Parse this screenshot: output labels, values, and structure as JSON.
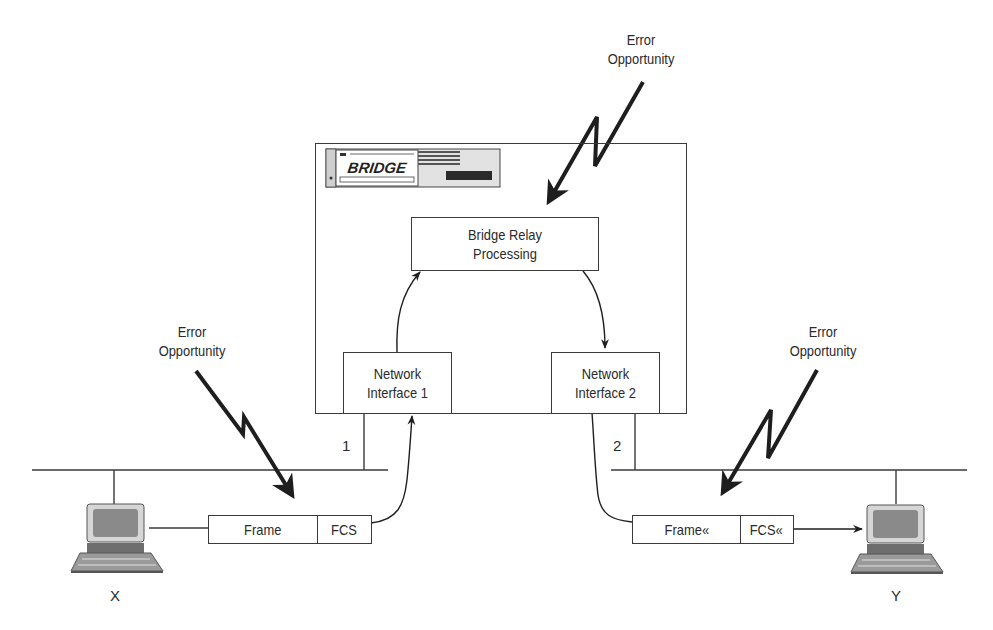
{
  "diagram": {
    "type": "network-bridge-error-opportunities",
    "bridge": {
      "device_label": "BRIDGE",
      "relay": {
        "line1": "Bridge Relay",
        "line2": "Processing"
      },
      "interfaces": [
        {
          "line1": "Network",
          "line2": "Interface 1",
          "port": "1"
        },
        {
          "line1": "Network",
          "line2": "Interface 2",
          "port": "2"
        }
      ]
    },
    "error_labels": [
      {
        "line1": "Error",
        "line2": "Opportunity",
        "position": "top"
      },
      {
        "line1": "Error",
        "line2": "Opportunity",
        "position": "left"
      },
      {
        "line1": "Error",
        "line2": "Opportunity",
        "position": "right"
      }
    ],
    "frames": [
      {
        "frame": "Frame",
        "fcs": "FCS"
      },
      {
        "frame": "Frame«",
        "fcs": "FCS«"
      }
    ],
    "stations": [
      {
        "label": "X",
        "icon": "computer-icon"
      },
      {
        "label": "Y",
        "icon": "computer-icon"
      }
    ],
    "colors": {
      "line": "#3a3a3a",
      "bolt": "#1e1e1e",
      "screen": "#8a8a8a",
      "device_panel": "#d8d8d8"
    }
  }
}
